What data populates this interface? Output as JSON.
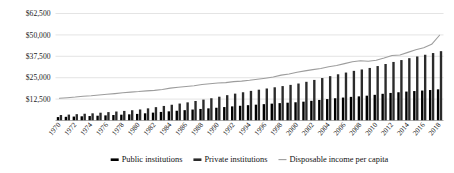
{
  "chart_data": {
    "type": "bar",
    "title": "",
    "subtitle": "",
    "xlabel": "",
    "ylabel": "",
    "ylim": [
      0,
      62500
    ],
    "grid": true,
    "legend_position": "bottom",
    "ytick_labels": [
      "$62,500",
      "$50,000",
      "$37,500",
      "$25,000",
      "$12,500"
    ],
    "ytick_values": [
      62500,
      50000,
      37500,
      25000,
      12500
    ],
    "categories": [
      "1970",
      "1971",
      "1972",
      "1973",
      "1974",
      "1975",
      "1976",
      "1977",
      "1978",
      "1979",
      "1980",
      "1981",
      "1982",
      "1983",
      "1984",
      "1985",
      "1986",
      "1987",
      "1988",
      "1989",
      "1990",
      "1991",
      "1992",
      "1993",
      "1994",
      "1995",
      "1996",
      "1997",
      "1998",
      "1999",
      "2000",
      "2001",
      "2002",
      "2003",
      "2004",
      "2005",
      "2006",
      "2007",
      "2008",
      "2009",
      "2010",
      "2011",
      "2012",
      "2013",
      "2014",
      "2015",
      "2016",
      "2017",
      "2018"
    ],
    "xtick_labels": [
      "1970",
      "1972",
      "1974",
      "1976",
      "1978",
      "1980",
      "1982",
      "1984",
      "1986",
      "1988",
      "1990",
      "1992",
      "1994",
      "1996",
      "1998",
      "2000",
      "2002",
      "2004",
      "2006",
      "2008",
      "2010",
      "2012",
      "2014",
      "2016",
      "2018"
    ],
    "series": [
      {
        "name": "Public institutions",
        "kind": "bar",
        "color": "#000000",
        "values": [
          2000,
          2150,
          2300,
          2450,
          2600,
          2800,
          3000,
          3200,
          3400,
          3600,
          3850,
          4200,
          4600,
          5000,
          5350,
          5700,
          6050,
          6400,
          6750,
          7100,
          7450,
          7850,
          8250,
          8600,
          8950,
          9250,
          9550,
          9850,
          10150,
          10400,
          10650,
          11000,
          11500,
          12000,
          12500,
          13000,
          13400,
          13800,
          14100,
          14500,
          15000,
          15600,
          16100,
          16500,
          16900,
          17200,
          17500,
          17800,
          18200
        ]
      },
      {
        "name": "Private institutions",
        "kind": "bar",
        "color": "#2b2b2b",
        "values": [
          3200,
          3450,
          3700,
          3950,
          4200,
          4550,
          4900,
          5250,
          5600,
          6000,
          6450,
          7100,
          7800,
          8500,
          9200,
          9900,
          10600,
          11400,
          12200,
          13000,
          13900,
          14800,
          15700,
          16500,
          17300,
          18000,
          18700,
          19400,
          20100,
          20800,
          21600,
          22600,
          23700,
          24800,
          25900,
          27000,
          28000,
          29000,
          29800,
          30700,
          31800,
          33000,
          34200,
          35300,
          36400,
          37400,
          38400,
          39400,
          40500
        ]
      },
      {
        "name": "Disposable income per capita",
        "kind": "line",
        "color": "#9d9d9d",
        "values": [
          13000,
          13300,
          13700,
          14200,
          14500,
          14900,
          15300,
          15700,
          16200,
          16600,
          16900,
          17300,
          17600,
          18100,
          18900,
          19400,
          19900,
          20300,
          21000,
          21500,
          21900,
          22100,
          22700,
          23000,
          23500,
          24100,
          24700,
          25400,
          26500,
          27200,
          28200,
          29000,
          29700,
          30400,
          31400,
          32100,
          33200,
          34300,
          34900,
          34600,
          35200,
          36500,
          38000,
          38300,
          39800,
          41300,
          42500,
          44500,
          49800
        ]
      }
    ],
    "legend": [
      {
        "label": "Public institutions",
        "marker": "bar",
        "color": "#000000"
      },
      {
        "label": "Private institutions",
        "marker": "bar",
        "color": "#2b2b2b"
      },
      {
        "label": "Disposable income per capita",
        "marker": "line",
        "color": "#9d9d9d"
      }
    ]
  }
}
